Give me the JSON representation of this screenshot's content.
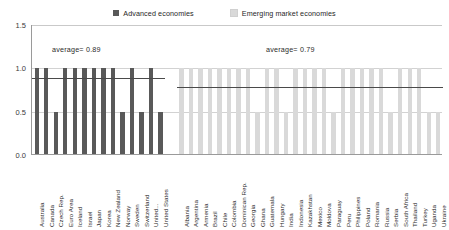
{
  "legend": {
    "items": [
      {
        "label": "Advanced economies",
        "color": "#595959",
        "icon": "square-swatch"
      },
      {
        "label": "Emerging market economies",
        "color": "#d9d9d9",
        "icon": "square-swatch"
      }
    ]
  },
  "annotations": {
    "advanced_average_label": "average= 0.89",
    "emerging_average_label": "average= 0.79"
  },
  "chart_data": {
    "type": "bar",
    "title": "",
    "subtitle": "",
    "xlabel": "",
    "ylabel": "",
    "ylim": [
      0.0,
      1.5
    ],
    "yticks": [
      "0.0",
      "0.5",
      "1.0",
      "1.5"
    ],
    "ytick_values": [
      0.0,
      0.5,
      1.0,
      1.5
    ],
    "grid": true,
    "legend_position": "top-center",
    "series": [
      {
        "name": "Advanced economies",
        "color": "#595959",
        "average": 0.89,
        "categories": [
          "Australia",
          "Canada",
          "Czech Rep.",
          "Euro Area",
          "Iceland",
          "Israel",
          "Japan",
          "Korea",
          "New Zealand",
          "Norway",
          "Sweden",
          "Switzerland",
          "United...",
          "United States"
        ],
        "values": [
          1.0,
          1.0,
          0.5,
          1.0,
          1.0,
          1.0,
          1.0,
          1.0,
          1.0,
          0.5,
          1.0,
          0.5,
          1.0,
          0.5
        ]
      },
      {
        "name": "Emerging market economies",
        "color": "#d9d9d9",
        "average": 0.79,
        "categories": [
          "Albania",
          "Argentina",
          "Armenia",
          "Brazil",
          "Chile",
          "Colombia",
          "Dominican Rep.",
          "Georgia",
          "Ghana",
          "Guatemala",
          "Hungary",
          "India",
          "Indonesia",
          "Kazakhstan",
          "Mexico",
          "Moldova",
          "Paraguay",
          "Peru",
          "Philippines",
          "Poland",
          "Romania",
          "Russia",
          "Serbia",
          "South Africa",
          "Thailand",
          "Turkey",
          "Uganda",
          "Ukraine"
        ],
        "values": [
          1.0,
          1.0,
          1.0,
          1.0,
          1.0,
          1.0,
          1.0,
          1.0,
          0.5,
          1.0,
          1.0,
          0.5,
          1.0,
          1.0,
          1.0,
          1.0,
          0.5,
          1.0,
          1.0,
          1.0,
          1.0,
          1.0,
          0.5,
          1.0,
          1.0,
          1.0,
          0.5,
          0.5
        ]
      }
    ]
  }
}
